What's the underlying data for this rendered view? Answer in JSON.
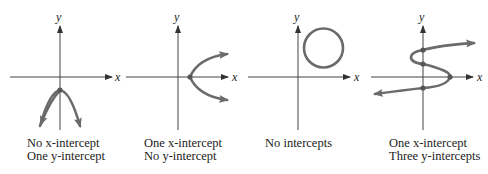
{
  "panels": [
    {
      "id": "parabola-down",
      "axis_labels": {
        "x": "x",
        "y": "y"
      },
      "caption": [
        "No x-intercept",
        "One y-intercept"
      ]
    },
    {
      "id": "parabola-right",
      "axis_labels": {
        "x": "x",
        "y": "y"
      },
      "caption": [
        "One x-intercept",
        "No y-intercept"
      ]
    },
    {
      "id": "circle",
      "axis_labels": {
        "x": "x",
        "y": "y"
      },
      "caption": [
        "No intercepts"
      ]
    },
    {
      "id": "s-curve",
      "axis_labels": {
        "x": "x",
        "y": "y"
      },
      "caption": [
        "One x-intercept",
        "Three y-intercepts"
      ]
    }
  ],
  "colors": {
    "axis": "#444444",
    "curve": "#6b6b6b"
  }
}
